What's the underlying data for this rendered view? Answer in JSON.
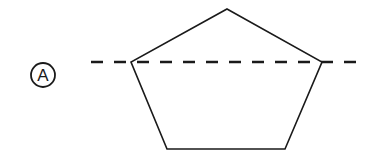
{
  "figure": {
    "label": "A",
    "shape": "pentagon",
    "stroke_color": "#1a1a1a",
    "background": "#ffffff",
    "pentagon_points": [
      [
        227,
        9
      ],
      [
        322,
        62
      ],
      [
        285,
        149
      ],
      [
        167,
        149
      ],
      [
        131,
        62
      ]
    ],
    "dashed_line": {
      "x1": 91,
      "y1": 62,
      "x2": 362,
      "y2": 62,
      "style": "dashed"
    },
    "label_circle": {
      "cx": 43,
      "cy": 75,
      "r": 12
    }
  }
}
